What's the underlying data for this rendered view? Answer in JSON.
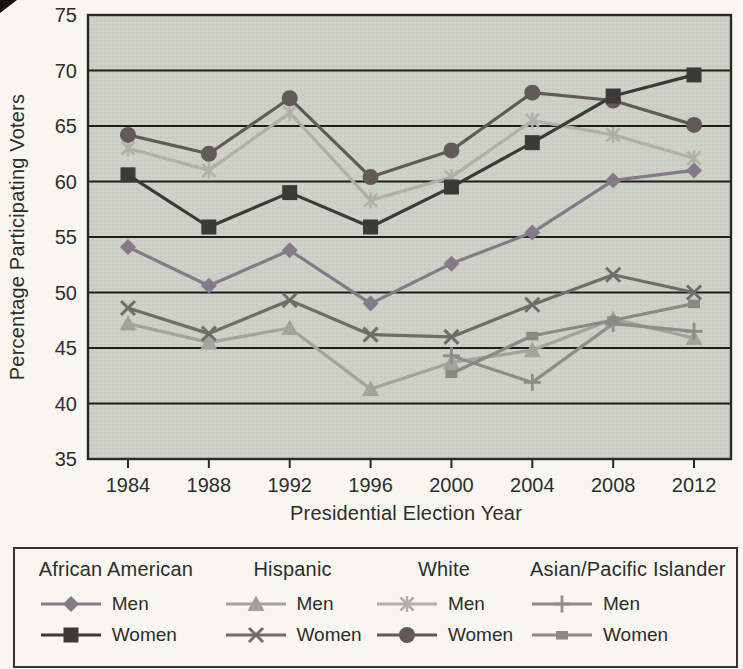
{
  "page": {
    "background": "#f7f6f1",
    "text_color": "#2e2d2a"
  },
  "chart_data": {
    "type": "line",
    "title": "",
    "xlabel": "Presidential Election Year",
    "ylabel": "Percentage Participating Voters",
    "x": [
      1984,
      1988,
      1992,
      1996,
      2000,
      2004,
      2008,
      2012
    ],
    "ylim": [
      35,
      75
    ],
    "ytick_step": 5,
    "yticks": [
      35,
      40,
      45,
      50,
      55,
      60,
      65,
      70,
      75
    ],
    "grid": true,
    "plot_bg": "#ced1c6",
    "plot_dot_color": "#bcbfb3",
    "grid_color": "#1f1e1a",
    "border_color": "#2a2925",
    "legend_position": "bottom",
    "legend_groups": [
      "African American",
      "Hispanic",
      "White",
      "Asian/Pacific Islander"
    ],
    "series": [
      {
        "group": "African American",
        "name": "Men",
        "marker": "diamond",
        "color": "#85798a",
        "values": [
          54.1,
          50.6,
          53.8,
          49.0,
          52.6,
          55.4,
          60.1,
          61.0
        ]
      },
      {
        "group": "African American",
        "name": "Women",
        "marker": "square",
        "color": "#3b3a38",
        "values": [
          60.6,
          55.9,
          59.0,
          55.9,
          59.5,
          63.5,
          67.7,
          69.6
        ]
      },
      {
        "group": "Hispanic",
        "name": "Men",
        "marker": "triangle",
        "color": "#a3a29c",
        "values": [
          47.2,
          45.5,
          46.8,
          41.3,
          43.7,
          44.8,
          47.6,
          45.9
        ]
      },
      {
        "group": "Hispanic",
        "name": "Women",
        "marker": "x",
        "color": "#6f6d69",
        "values": [
          48.6,
          46.3,
          49.3,
          46.2,
          46.0,
          48.9,
          51.6,
          50.0
        ]
      },
      {
        "group": "White",
        "name": "Men",
        "marker": "asterisk",
        "color": "#b0afa9",
        "values": [
          63.0,
          61.0,
          66.2,
          58.3,
          60.4,
          65.5,
          64.2,
          62.1
        ]
      },
      {
        "group": "White",
        "name": "Women",
        "marker": "circle",
        "color": "#615a56",
        "values": [
          64.2,
          62.5,
          67.5,
          60.4,
          62.8,
          68.0,
          67.3,
          65.1
        ]
      },
      {
        "group": "Asian/Pacific Islander",
        "name": "Men",
        "marker": "plus",
        "color": "#8e8d88",
        "values": [
          null,
          null,
          null,
          null,
          44.3,
          41.9,
          47.2,
          46.5
        ]
      },
      {
        "group": "Asian/Pacific Islander",
        "name": "Women",
        "marker": "dash",
        "color": "#8a8984",
        "values": [
          null,
          null,
          null,
          null,
          42.7,
          46.1,
          47.5,
          49.0
        ]
      }
    ]
  }
}
